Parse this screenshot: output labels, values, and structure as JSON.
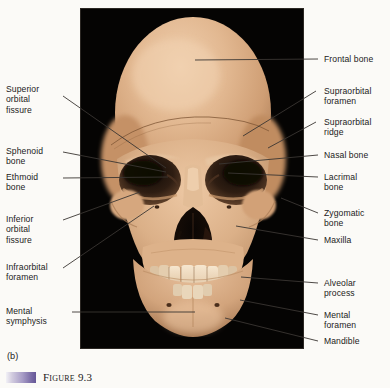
{
  "figure": {
    "panel_letter": "(b)",
    "caption_label": "Figure",
    "caption_number": "9.3",
    "caption_full": "FIGURE 9.3",
    "accent_color": "#7a6ca6",
    "background_color": "#fbfaf7",
    "photo_background_color": "#050403",
    "bone_color": "#d9ab83",
    "leader_color": "#3a3632"
  },
  "labels_left": [
    {
      "id": "superior-orbital-fissure",
      "text": "Superior\norbital\nfissure"
    },
    {
      "id": "sphenoid-bone",
      "text": "Sphenoid\nbone"
    },
    {
      "id": "ethmoid-bone",
      "text": "Ethmoid\nbone"
    },
    {
      "id": "inferior-orbital-fissure",
      "text": "Inferior\norbital\nfissure"
    },
    {
      "id": "infraorbital-foramen",
      "text": "Infraorbital\nforamen"
    },
    {
      "id": "mental-symphysis",
      "text": "Mental\nsymphysis"
    }
  ],
  "labels_right": [
    {
      "id": "frontal-bone",
      "text": "Frontal bone"
    },
    {
      "id": "supraorbital-foramen",
      "text": "Supraorbital\nforamen"
    },
    {
      "id": "supraorbital-ridge",
      "text": "Supraorbital\nridge"
    },
    {
      "id": "nasal-bone",
      "text": "Nasal bone"
    },
    {
      "id": "lacrimal-bone",
      "text": "Lacrimal\nbone"
    },
    {
      "id": "zygomatic-bone",
      "text": "Zygomatic\nbone"
    },
    {
      "id": "maxilla",
      "text": "Maxilla"
    },
    {
      "id": "alveolar-process",
      "text": "Alveolar\nprocess"
    },
    {
      "id": "mental-foramen",
      "text": "Mental\nforamen"
    },
    {
      "id": "mandible",
      "text": "Mandible"
    }
  ]
}
